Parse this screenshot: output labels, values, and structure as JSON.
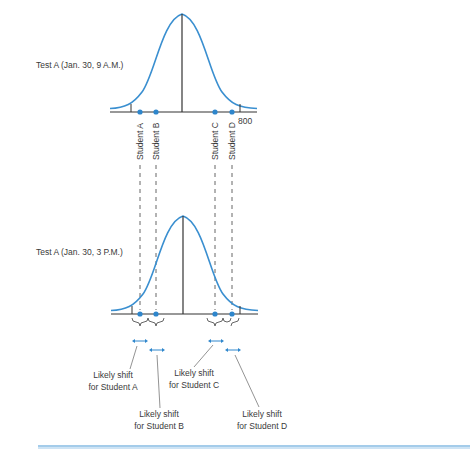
{
  "colors": {
    "curve": "#3a8fd0",
    "dot": "#2e86cc",
    "axis": "#333333",
    "dash": "#555555",
    "rule": "#4a9ad6"
  },
  "panels": {
    "top": {
      "label": "Test A (Jan. 30, 9 A.M.)",
      "axis_label": "800"
    },
    "bottom": {
      "label": "Test A (Jan. 30, 3 P.M.)"
    }
  },
  "students": [
    {
      "id": "A",
      "label": "Student A"
    },
    {
      "id": "B",
      "label": "Student B"
    },
    {
      "id": "C",
      "label": "Student C"
    },
    {
      "id": "D",
      "label": "Student D"
    }
  ],
  "callouts": [
    {
      "line1": "Likely shift",
      "line2": "for Student A"
    },
    {
      "line1": "Likely shift",
      "line2": "for Student B"
    },
    {
      "line1": "Likely shift",
      "line2": "for Student C"
    },
    {
      "line1": "Likely shift",
      "line2": "for Student D"
    }
  ]
}
